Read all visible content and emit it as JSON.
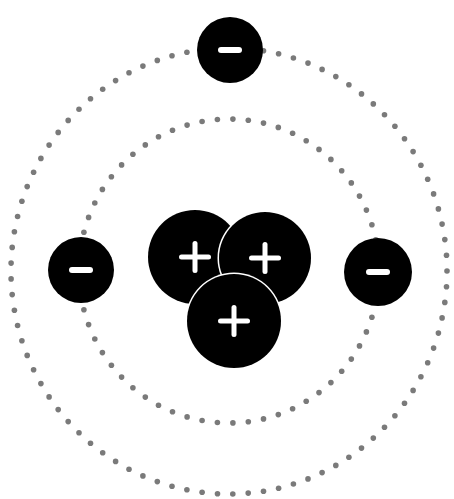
{
  "diagram": {
    "colors": {
      "background": "#ffffff",
      "particle": "#000000",
      "symbol": "#ffffff",
      "orbit": "#7a7a7a"
    },
    "orbits": [
      {
        "name": "inner-orbit",
        "cx": 229,
        "cy": 271,
        "rx": 150,
        "ry": 152
      },
      {
        "name": "outer-orbit",
        "cx": 229,
        "cy": 271,
        "rx": 218,
        "ry": 223
      }
    ],
    "protons": [
      {
        "label": "+",
        "cx": 195,
        "cy": 257,
        "r": 47
      },
      {
        "label": "+",
        "cx": 265,
        "cy": 258,
        "r": 46
      },
      {
        "label": "+",
        "cx": 234,
        "cy": 321,
        "r": 47
      }
    ],
    "electrons": [
      {
        "label": "−",
        "cx": 230,
        "cy": 50,
        "r": 33
      },
      {
        "label": "−",
        "cx": 81,
        "cy": 270,
        "r": 33
      },
      {
        "label": "−",
        "cx": 378,
        "cy": 272,
        "r": 34
      }
    ]
  }
}
